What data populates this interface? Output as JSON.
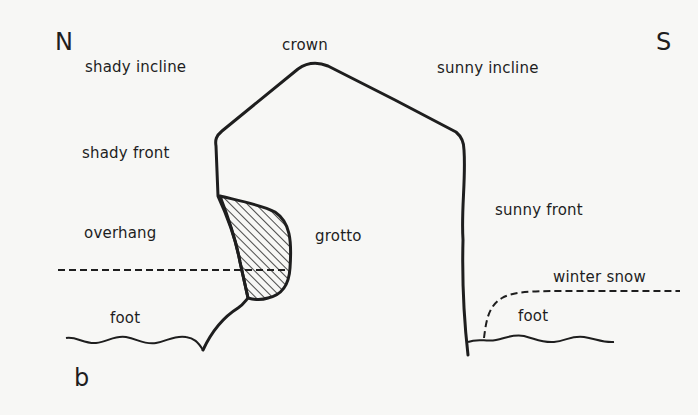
{
  "figure": {
    "panel_letter": "b",
    "orientation": {
      "north": "N",
      "south": "S"
    },
    "labels": {
      "crown": "crown",
      "shady_incline": "shady incline",
      "sunny_incline": "sunny incline",
      "shady_front": "shady front",
      "sunny_front": "sunny front",
      "overhang": "overhang",
      "grotto": "grotto",
      "foot_left": "foot",
      "foot_right": "foot",
      "winter_snow": "winter snow"
    },
    "colors": {
      "ink": "#1e1e1e",
      "paper": "#f7f7f5"
    }
  }
}
